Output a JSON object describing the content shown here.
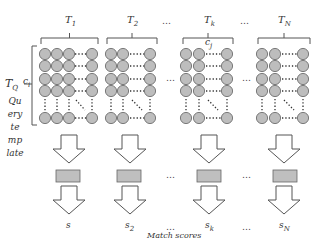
{
  "diagram": {
    "groups": [
      {
        "id": "T1",
        "label": "T",
        "sub": "1",
        "score_label": "s",
        "score_sub": ""
      },
      {
        "id": "T2",
        "label": "T",
        "sub": "2",
        "score_label": "s",
        "score_sub": "2"
      },
      {
        "id": "Tk",
        "label": "T",
        "sub": "k",
        "score_label": "s",
        "score_sub": "k"
      },
      {
        "id": "TN",
        "label": "T",
        "sub": "N",
        "score_label": "s",
        "score_sub": "N"
      }
    ],
    "ellipsis": "…",
    "column_label": {
      "main": "c",
      "sub": "j"
    },
    "row_label": {
      "main": "c",
      "sub": "i"
    },
    "query_label": {
      "main": "T",
      "sub": "Q"
    },
    "query_caption_lines": [
      "Qu",
      "ery",
      "te",
      "mp",
      "late"
    ],
    "footer": "Match scores",
    "colors": {
      "circle_fill": "#bdbdbd",
      "circle_stroke": "#6e6e6e",
      "rect_fill": "#bfbfbf",
      "line": "#555555"
    }
  }
}
